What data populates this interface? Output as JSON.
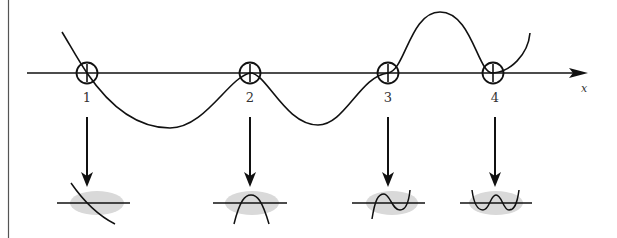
{
  "diagram": {
    "title": "",
    "axis": {
      "label": "x",
      "color": "#111111"
    },
    "colors": {
      "stroke": "#111111",
      "highlight": "#d9d9d9",
      "border": "#555555"
    },
    "points": [
      {
        "id": "1",
        "label": "1",
        "behavior": "simple root (curve crosses axis, decreasing)"
      },
      {
        "id": "2",
        "label": "2",
        "behavior": "double root (local maximum touching axis)"
      },
      {
        "id": "3",
        "label": "3",
        "behavior": "triple root (inflection point, flat crossing)"
      },
      {
        "id": "4",
        "label": "4",
        "behavior": "double root (local minimum touching axis)"
      }
    ]
  }
}
